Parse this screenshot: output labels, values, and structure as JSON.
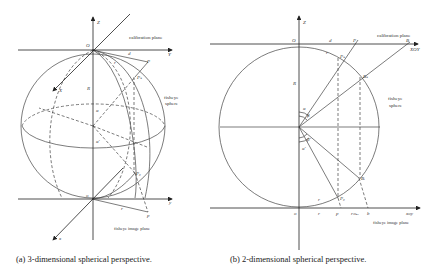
{
  "figure": {
    "panel_a": {
      "caption": "(a) 3-dimensional spherical perspective.",
      "labels": {
        "z_axis": "Z",
        "origin_top": "O",
        "y_axis_top": "Y",
        "x_axis_top": "X",
        "calibration_plane": "calibration plane",
        "d": "d",
        "r_top": "r",
        "p_top": "P",
        "ps": "Pₛ",
        "radius": "R",
        "fisheye_sphere_1": "fisheye",
        "fisheye_sphere_2": "sphere",
        "alpha": "α",
        "alpha_prime": "α'",
        "pd": "P₀",
        "origin_bottom": "o",
        "y_axis_bottom": "y",
        "x_axis_bottom": "x",
        "r_bottom": "r",
        "p_bottom": "p",
        "fisheye_image_plane": "fisheye image plane"
      }
    },
    "panel_b": {
      "caption": "(b) 2-dimensional spherical perspective.",
      "labels": {
        "z_axis": "Z",
        "origin_top": "O",
        "d": "d",
        "p_top": "P",
        "calibration_plane": "calibration plane",
        "b_top": "B",
        "xoy": "XOY",
        "r_top": "r",
        "ps": "Pₛ",
        "bs": "Bₛ",
        "radius": "R",
        "fisheye_sphere_1": "fisheye",
        "fisheye_sphere_2": "sphere",
        "alpha": "α",
        "beta": "β",
        "alpha_prime": "α'",
        "beta_prime": "β'",
        "bd": "Bᵢ",
        "pd": "P₀",
        "origin_bottom": "o",
        "r_bottom": "r",
        "p_bottom": "p",
        "r_max": "rₘₐₓ",
        "b_bottom": "b",
        "xoy_bottom": "xoy",
        "fisheye_image_plane": "fisheye image plane"
      }
    }
  }
}
